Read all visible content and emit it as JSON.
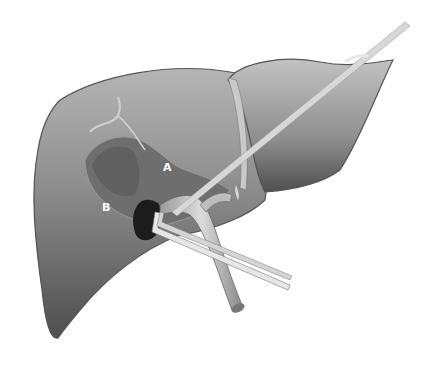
{
  "figure": {
    "type": "anatomical illustration",
    "caption_fragment": "",
    "labels": [
      {
        "id": "A",
        "text": "A"
      },
      {
        "id": "B",
        "text": "B"
      }
    ],
    "colors": {
      "background": "#ffffff",
      "liver_light": "#b8b8b8",
      "liver_mid": "#8a8a8a",
      "liver_dark": "#4a4a4a",
      "lesion": "#1a1a1a",
      "needle": "#e2e2e2",
      "label_text": "#ffffff"
    }
  }
}
